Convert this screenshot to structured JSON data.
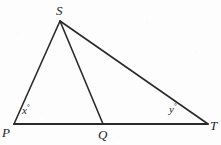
{
  "figure": {
    "type": "geometry-diagram",
    "background_color": "#fdfdfd",
    "stroke_color": "#2a2a2a",
    "label_color": "#232323",
    "width": 221,
    "height": 145,
    "points": [
      {
        "name": "S",
        "label": "S",
        "x": 60,
        "y": 21,
        "label_x": 56,
        "label_y": 4,
        "position": "above"
      },
      {
        "name": "P",
        "label": "P",
        "x": 14,
        "y": 124,
        "label_x": 2,
        "label_y": 126,
        "position": "below-left"
      },
      {
        "name": "Q",
        "label": "Q",
        "x": 103,
        "y": 124,
        "label_x": 98,
        "label_y": 128,
        "position": "below"
      },
      {
        "name": "T",
        "label": "T",
        "x": 208,
        "y": 124,
        "label_x": 210,
        "label_y": 119,
        "position": "right"
      }
    ],
    "segments": [
      {
        "name": "PS",
        "from": "P",
        "to": "S",
        "x1": 14,
        "y1": 124,
        "x2": 60,
        "y2": 21,
        "width": 1.6
      },
      {
        "name": "ST",
        "from": "S",
        "to": "T",
        "x1": 60,
        "y1": 21,
        "x2": 208,
        "y2": 124,
        "width": 1.6
      },
      {
        "name": "PT",
        "from": "P",
        "to": "T",
        "x1": 14,
        "y1": 124,
        "x2": 208,
        "y2": 124,
        "width": 1.8
      },
      {
        "name": "SQ",
        "from": "S",
        "to": "Q",
        "x1": 60,
        "y1": 21,
        "x2": 103,
        "y2": 124,
        "width": 1.6
      }
    ],
    "angles": [
      {
        "name": "angle-at-P",
        "variable": "x",
        "degree_symbol": "°",
        "at_vertex": "P",
        "label_x": 22,
        "label_y": 104
      },
      {
        "name": "angle-at-T",
        "variable": "y",
        "degree_symbol": "°",
        "at_vertex": "T",
        "label_x": 169,
        "label_y": 103
      }
    ]
  }
}
